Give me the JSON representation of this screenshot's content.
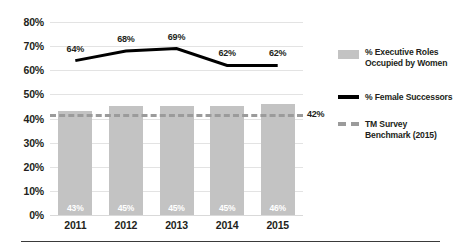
{
  "chart_data": {
    "type": "bar",
    "title": "",
    "subtitle": "",
    "xlabel": "",
    "ylabel": "",
    "ylim": [
      0,
      80
    ],
    "ytick_labels": [
      "80%",
      "70%",
      "60%",
      "50%",
      "40%",
      "30%",
      "20%",
      "10%",
      "0%"
    ],
    "ytick_values": [
      80,
      70,
      60,
      50,
      40,
      30,
      20,
      10,
      0
    ],
    "grid": true,
    "legend_position": "right",
    "categories": [
      "2011",
      "2012",
      "2013",
      "2014",
      "2015"
    ],
    "series": [
      {
        "name": "% Executive Roles Occupied by Women",
        "type": "bar",
        "color": "#c3c3c3",
        "values": [
          43,
          45,
          45,
          45,
          46
        ],
        "value_labels": [
          "43%",
          "45%",
          "45%",
          "45%",
          "46%"
        ]
      },
      {
        "name": "% Female Successors",
        "type": "line",
        "color": "#000000",
        "values": [
          64,
          68,
          69,
          62,
          62
        ],
        "value_labels": [
          "64%",
          "68%",
          "69%",
          "62%",
          "62%"
        ]
      },
      {
        "name": "TM Survey Benchmark (2015)",
        "type": "reference-line",
        "color": "#9b9b9b",
        "value": 42,
        "value_label": "42%"
      }
    ]
  },
  "legend": {
    "items": [
      {
        "swatch": "bar-swatch",
        "line1": "% Executive Roles",
        "line2": "Occupied by Women"
      },
      {
        "swatch": "line-swatch",
        "line1": "% Female Successors",
        "line2": ""
      },
      {
        "swatch": "dashed-swatch",
        "line1": "TM Survey",
        "line2": "Benchmark (2015)"
      }
    ]
  }
}
